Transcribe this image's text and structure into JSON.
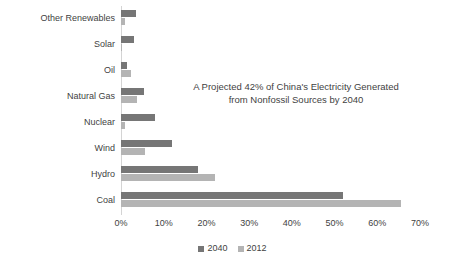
{
  "chart_data": {
    "type": "bar",
    "orientation": "horizontal",
    "title": "",
    "subtitle": "",
    "xlabel": "",
    "ylabel": "",
    "xlim": [
      0,
      70
    ],
    "xtick_labels": [
      "0%",
      "10%",
      "20%",
      "30%",
      "40%",
      "50%",
      "60%",
      "70%"
    ],
    "xticks": [
      0,
      10,
      20,
      30,
      40,
      50,
      60,
      70
    ],
    "grid": false,
    "legend_position": "bottom",
    "categories": [
      "Other Renewables",
      "Solar",
      "Oil",
      "Natural Gas",
      "Nuclear",
      "Wind",
      "Hydro",
      "Coal"
    ],
    "series": [
      {
        "name": "2040",
        "color": "#767676",
        "values": [
          3.5,
          3.0,
          1.5,
          5.5,
          8.0,
          12.0,
          18.0,
          52.0
        ]
      },
      {
        "name": "2012",
        "color": "#b4b4b4",
        "values": [
          1.0,
          0.3,
          2.3,
          3.8,
          1.0,
          5.7,
          22.0,
          65.5
        ]
      }
    ],
    "annotations": [
      {
        "line1": "A Projected 42% of China's Electricity Generated",
        "line2": "from Nonfossil Sources by 2040"
      }
    ]
  },
  "legend": {
    "items": [
      {
        "label": "2040",
        "color": "#767676"
      },
      {
        "label": "2012",
        "color": "#b4b4b4"
      }
    ]
  },
  "colors": {
    "series_2040": "#767676",
    "series_2012": "#b4b4b4",
    "axis": "#d4d4d4",
    "text": "#3f3f3f",
    "background": "#ffffff"
  }
}
